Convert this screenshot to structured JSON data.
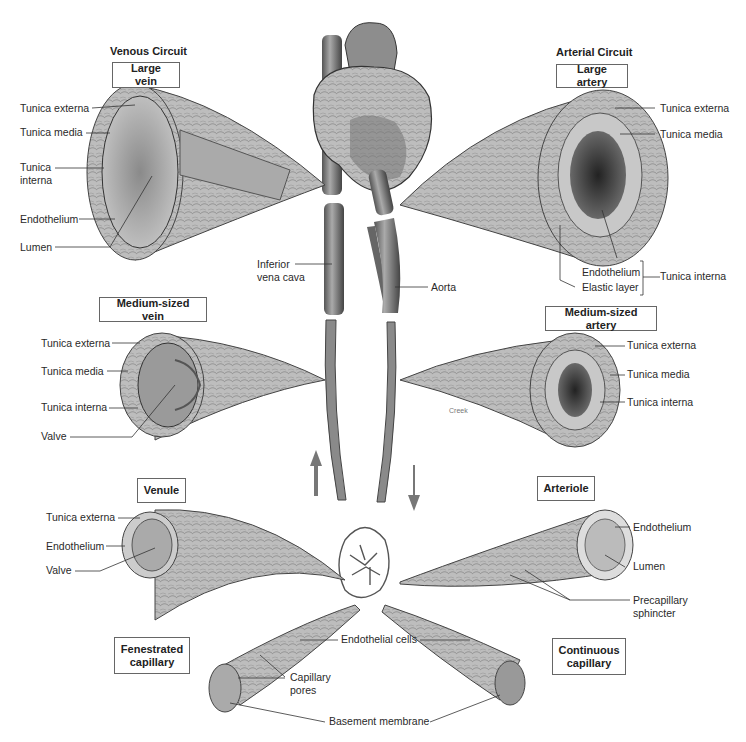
{
  "venous": {
    "title": "Venous Circuit",
    "large_vein": {
      "box": "Large vein",
      "labels": [
        "Tunica externa",
        "Tunica media",
        "Tunica interna",
        "Endothelium",
        "Lumen"
      ]
    },
    "medium_vein": {
      "box": "Medium-sized vein",
      "labels": [
        "Tunica externa",
        "Tunica media",
        "Tunica interna",
        "Valve"
      ]
    },
    "venule": {
      "box": "Venule",
      "labels": [
        "Tunica externa",
        "Endothelium",
        "Valve"
      ]
    },
    "inferior_vena_cava": "Inferior vena cava"
  },
  "arterial": {
    "title": "Arterial Circuit",
    "large_artery": {
      "box": "Large artery",
      "labels": [
        "Tunica externa",
        "Tunica media",
        "Endothelium",
        "Elastic layer"
      ],
      "bracket_label": "Tunica interna"
    },
    "medium_artery": {
      "box": "Medium-sized artery",
      "labels": [
        "Tunica externa",
        "Tunica media",
        "Tunica interna"
      ],
      "watermark": "Creek"
    },
    "arteriole": {
      "box": "Arteriole",
      "labels": [
        "Endothelium",
        "Lumen",
        "Precapillary sphincter"
      ]
    },
    "aorta": "Aorta"
  },
  "capillaries": {
    "fenestrated": {
      "box": "Fenestrated capillary",
      "pores": "Capillary pores"
    },
    "continuous": {
      "box": "Continuous capillary"
    },
    "endothelial_cells": "Endothelial cells",
    "basement_membrane": "Basement membrane"
  },
  "colors": {
    "tissue": "#b8b8b8",
    "tissue_dark": "#6a6a6a",
    "line": "#333333",
    "box_border": "#666666"
  }
}
